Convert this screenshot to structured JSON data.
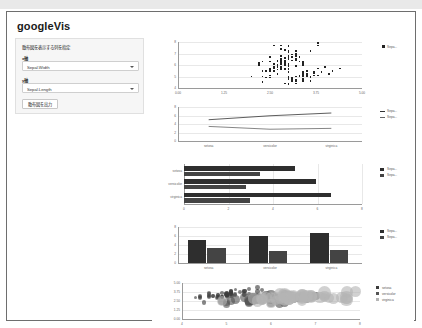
{
  "window": {
    "title": "googleVis"
  },
  "sidebar": {
    "instruction": "散布図を表示する列を指定",
    "field1": {
      "label": "x軸",
      "value": "Sepal.Width"
    },
    "field2": {
      "label": "y軸",
      "value": "Sepal.Length"
    },
    "button": {
      "label": "散布図を出力"
    }
  },
  "chart_data": [
    {
      "type": "scatter",
      "title": "",
      "xlabel": "",
      "ylabel": "",
      "xlim": [
        0,
        5
      ],
      "ylim": [
        4,
        8
      ],
      "xticks": [
        "0.00",
        "1.25",
        "2.50",
        "3.75",
        "5.00"
      ],
      "yticks": [
        "4",
        "5",
        "6",
        "7",
        "8"
      ],
      "grid": true,
      "legend_position": "right",
      "legend": [
        "Sepa..."
      ],
      "series": [
        {
          "name": "Sepal.Length",
          "x": [
            3.5,
            3.0,
            3.2,
            3.1,
            3.6,
            3.9,
            3.4,
            3.4,
            2.9,
            3.1,
            3.7,
            3.4,
            3.0,
            3.0,
            4.0,
            4.4,
            3.9,
            3.5,
            3.8,
            3.8,
            3.4,
            3.7,
            3.6,
            3.3,
            3.4,
            3.0,
            3.4,
            3.5,
            3.4,
            3.2,
            3.1,
            3.4,
            4.1,
            4.2,
            3.1,
            3.2,
            3.5,
            3.6,
            3.0,
            3.4,
            3.5,
            2.3,
            3.2,
            3.5,
            3.8,
            3.0,
            3.8,
            3.2,
            3.7,
            3.3,
            3.2,
            3.2,
            3.1,
            2.3,
            2.8,
            2.8,
            3.3,
            2.4,
            2.9,
            2.7,
            2.0,
            3.0,
            2.2,
            2.9,
            2.9,
            3.1,
            3.0,
            2.7,
            2.2,
            2.5,
            3.2,
            2.8,
            2.5,
            2.8,
            2.9,
            3.0,
            2.8,
            3.0,
            2.9,
            2.6,
            2.4,
            2.4,
            2.7,
            2.7,
            3.0,
            3.4,
            3.1,
            2.3,
            3.0,
            2.5,
            2.6,
            3.0,
            2.6,
            2.3,
            2.7,
            3.0,
            2.9,
            2.9,
            2.5,
            2.8,
            3.3,
            2.7,
            3.0,
            2.9,
            3.0,
            3.0,
            2.5,
            2.9,
            2.5,
            3.6,
            3.2,
            2.7,
            3.0,
            2.5,
            2.8,
            3.2,
            3.0,
            3.8,
            2.6,
            2.2,
            3.2,
            2.8,
            2.8,
            2.7,
            3.3,
            3.2,
            2.8,
            3.0,
            2.8,
            3.0,
            2.8,
            3.8,
            2.8,
            2.8,
            2.6,
            3.0,
            3.4,
            3.1,
            3.0,
            3.1,
            3.1,
            3.1,
            2.7,
            3.2,
            3.3,
            3.0,
            2.5,
            3.0,
            3.4,
            3.0
          ],
          "y": [
            5.1,
            4.9,
            4.7,
            4.6,
            5.0,
            5.4,
            4.6,
            5.0,
            4.4,
            4.9,
            5.4,
            4.8,
            4.8,
            4.3,
            5.8,
            5.7,
            5.4,
            5.1,
            5.7,
            5.1,
            5.4,
            5.1,
            4.6,
            5.1,
            4.8,
            5.0,
            5.0,
            5.2,
            5.2,
            4.7,
            4.8,
            5.4,
            5.2,
            5.5,
            4.9,
            5.0,
            5.5,
            4.9,
            4.4,
            5.1,
            5.0,
            4.5,
            4.4,
            5.0,
            5.1,
            4.8,
            5.1,
            4.6,
            5.3,
            5.0,
            7.0,
            6.4,
            6.9,
            5.5,
            6.5,
            5.7,
            6.3,
            4.9,
            6.6,
            5.2,
            5.0,
            5.9,
            6.0,
            6.1,
            5.6,
            6.7,
            5.6,
            5.8,
            6.2,
            5.6,
            5.9,
            6.1,
            6.3,
            6.1,
            6.4,
            6.6,
            6.8,
            6.7,
            6.0,
            5.7,
            5.5,
            5.5,
            5.8,
            6.0,
            5.4,
            6.0,
            6.7,
            6.3,
            5.6,
            5.5,
            5.5,
            6.1,
            5.8,
            5.0,
            5.6,
            5.7,
            5.7,
            6.2,
            5.1,
            5.7,
            6.3,
            5.8,
            7.1,
            6.3,
            6.5,
            7.6,
            4.9,
            7.3,
            6.7,
            7.2,
            6.5,
            6.4,
            6.8,
            5.7,
            5.8,
            6.4,
            6.5,
            7.7,
            7.7,
            6.0,
            6.9,
            5.6,
            7.7,
            6.3,
            6.7,
            7.2,
            6.2,
            6.1,
            6.4,
            7.2,
            7.4,
            7.9,
            6.4,
            6.3,
            6.1,
            7.7,
            6.3,
            6.4,
            6.0,
            6.9,
            6.7,
            6.9,
            5.8,
            6.8,
            6.7,
            6.7,
            6.3,
            6.5,
            6.2,
            5.9
          ]
        }
      ]
    },
    {
      "type": "line",
      "xlabel": "",
      "ylabel": "",
      "categories": [
        "setosa",
        "versicolor",
        "virginica"
      ],
      "ylim": [
        0,
        8
      ],
      "yticks": [
        "0",
        "2",
        "4",
        "6",
        "8"
      ],
      "grid": true,
      "legend_position": "right",
      "legend": [
        "Sepa...",
        "Sepa..."
      ],
      "series": [
        {
          "name": "Sepal.Length",
          "values": [
            5.006,
            5.936,
            6.588
          ]
        },
        {
          "name": "Sepal.Width",
          "values": [
            3.428,
            2.77,
            2.974
          ]
        }
      ]
    },
    {
      "type": "bar",
      "orientation": "horizontal",
      "categories": [
        "setosa",
        "versicolor",
        "virginica"
      ],
      "xlim": [
        0,
        8
      ],
      "xticks": [
        "0",
        "2",
        "4",
        "6",
        "8"
      ],
      "grid": true,
      "legend_position": "right",
      "legend": [
        "Sepa...",
        "Sepa..."
      ],
      "series": [
        {
          "name": "Sepal.Length",
          "values": [
            5.006,
            5.936,
            6.588
          ]
        },
        {
          "name": "Sepal.Width",
          "values": [
            3.428,
            2.77,
            2.974
          ]
        }
      ]
    },
    {
      "type": "bar",
      "orientation": "vertical",
      "categories": [
        "setosa",
        "versicolor",
        "virginica"
      ],
      "ylim": [
        0,
        8
      ],
      "yticks": [
        "0",
        "2",
        "4",
        "6",
        "8"
      ],
      "grid": true,
      "legend_position": "right",
      "legend": [
        "Sepa...",
        "Sepa..."
      ],
      "series": [
        {
          "name": "Sepal.Length",
          "values": [
            5.006,
            5.936,
            6.588
          ]
        },
        {
          "name": "Sepal.Width",
          "values": [
            3.428,
            2.77,
            2.974
          ]
        }
      ]
    },
    {
      "type": "scatter",
      "variant": "bubble",
      "xlim": [
        4,
        8
      ],
      "ylim": [
        0,
        5
      ],
      "xticks": [
        "4",
        "5",
        "6",
        "7",
        "8"
      ],
      "yticks": [
        "0.00",
        "1.25",
        "2.50",
        "3.75",
        "5.00"
      ],
      "grid": true,
      "legend_position": "right",
      "legend": [
        "setosa",
        "versicolor",
        "virginica"
      ],
      "colors": {
        "setosa": "#3c3c3c",
        "versicolor": "#555555",
        "virginica": "#b5b5b5"
      },
      "series": [
        {
          "name": "setosa",
          "x": [
            5.1,
            4.9,
            4.7,
            4.6,
            5.0,
            5.4,
            4.6,
            5.0,
            4.4,
            4.9,
            5.4,
            4.8,
            4.8,
            4.3,
            5.8,
            5.7,
            5.4,
            5.1,
            5.7,
            5.1,
            5.4,
            5.1,
            4.6,
            5.1,
            4.8,
            5.0,
            5.0,
            5.2,
            5.2,
            4.7,
            4.8,
            5.4,
            5.2,
            5.5,
            4.9,
            5.0,
            5.5,
            4.9,
            4.4,
            5.1,
            5.0,
            4.5,
            4.4,
            5.0,
            5.1,
            4.8,
            5.1,
            4.6,
            5.3,
            5.0
          ],
          "y": [
            3.5,
            3.0,
            3.2,
            3.1,
            3.6,
            3.9,
            3.4,
            3.4,
            2.9,
            3.1,
            3.7,
            3.4,
            3.0,
            3.0,
            4.0,
            4.4,
            3.9,
            3.5,
            3.8,
            3.8,
            3.4,
            3.7,
            3.6,
            3.3,
            3.4,
            3.0,
            3.4,
            3.5,
            3.4,
            3.2,
            3.1,
            3.4,
            4.1,
            4.2,
            3.1,
            3.2,
            3.5,
            3.6,
            3.0,
            3.4,
            3.5,
            2.3,
            3.2,
            3.5,
            3.8,
            3.0,
            3.8,
            3.2,
            3.7,
            3.3
          ],
          "size": [
            0.2,
            0.2,
            0.2,
            0.2,
            0.2,
            0.4,
            0.3,
            0.2,
            0.2,
            0.1,
            0.2,
            0.2,
            0.1,
            0.1,
            0.2,
            0.4,
            0.4,
            0.3,
            0.3,
            0.3,
            0.2,
            0.4,
            0.2,
            0.5,
            0.2,
            0.2,
            0.4,
            0.2,
            0.2,
            0.2,
            0.2,
            0.4,
            0.1,
            0.2,
            0.2,
            0.2,
            0.2,
            0.1,
            0.2,
            0.2,
            0.3,
            0.3,
            0.2,
            0.6,
            0.4,
            0.3,
            0.2,
            0.2,
            0.2,
            0.2
          ]
        },
        {
          "name": "versicolor",
          "x": [
            7.0,
            6.4,
            6.9,
            5.5,
            6.5,
            5.7,
            6.3,
            4.9,
            6.6,
            5.2,
            5.0,
            5.9,
            6.0,
            6.1,
            5.6,
            6.7,
            5.6,
            5.8,
            6.2,
            5.6,
            5.9,
            6.1,
            6.3,
            6.1,
            6.4,
            6.6,
            6.8,
            6.7,
            6.0,
            5.7,
            5.5,
            5.5,
            5.8,
            6.0,
            5.4,
            6.0,
            6.7,
            6.3,
            5.6,
            5.5,
            5.5,
            6.1,
            5.8,
            5.0,
            5.6,
            5.7,
            5.7,
            6.2,
            5.1,
            5.7
          ],
          "y": [
            3.2,
            3.2,
            3.1,
            2.3,
            2.8,
            2.8,
            3.3,
            2.4,
            2.9,
            2.7,
            2.0,
            3.0,
            2.2,
            2.9,
            2.9,
            3.1,
            3.0,
            2.7,
            2.2,
            2.5,
            3.2,
            2.8,
            2.5,
            2.8,
            2.9,
            3.0,
            2.8,
            3.0,
            2.9,
            2.6,
            2.4,
            2.4,
            2.7,
            2.7,
            3.0,
            3.4,
            3.1,
            2.3,
            3.0,
            2.5,
            2.6,
            3.0,
            2.6,
            2.3,
            2.7,
            3.0,
            2.9,
            2.9,
            2.5,
            2.8
          ],
          "size": [
            1.4,
            1.5,
            1.5,
            1.3,
            1.5,
            1.3,
            1.6,
            1.0,
            1.3,
            1.4,
            1.0,
            1.5,
            1.0,
            1.4,
            1.3,
            1.4,
            1.5,
            1.0,
            1.5,
            1.1,
            1.8,
            1.3,
            1.5,
            1.2,
            1.3,
            1.4,
            1.4,
            1.7,
            1.5,
            1.0,
            1.1,
            1.0,
            1.2,
            1.6,
            1.5,
            1.6,
            1.5,
            1.3,
            1.3,
            1.2,
            1.4,
            1.4,
            1.2,
            1.0,
            1.3,
            1.2,
            1.3,
            1.3,
            1.1,
            1.3
          ]
        },
        {
          "name": "virginica",
          "x": [
            6.3,
            5.8,
            7.1,
            6.3,
            6.5,
            7.6,
            4.9,
            7.3,
            6.7,
            7.2,
            6.5,
            6.4,
            6.8,
            5.7,
            5.8,
            6.4,
            6.5,
            7.7,
            7.7,
            6.0,
            6.9,
            5.6,
            7.7,
            6.3,
            6.7,
            7.2,
            6.2,
            6.1,
            6.4,
            7.2,
            7.4,
            7.9,
            6.4,
            6.3,
            6.1,
            7.7,
            6.3,
            6.4,
            6.0,
            6.9,
            6.7,
            6.9,
            5.8,
            6.8,
            6.7,
            6.7,
            6.3,
            6.5,
            6.2,
            5.9
          ],
          "y": [
            3.3,
            2.7,
            3.0,
            2.9,
            3.0,
            3.0,
            2.5,
            2.9,
            2.5,
            3.6,
            3.2,
            2.7,
            3.0,
            2.5,
            2.8,
            3.2,
            3.0,
            3.8,
            2.6,
            2.2,
            3.2,
            2.8,
            2.8,
            2.7,
            3.3,
            3.2,
            2.8,
            3.0,
            2.8,
            3.0,
            2.8,
            3.8,
            2.8,
            2.8,
            2.6,
            3.0,
            3.4,
            3.1,
            3.0,
            3.1,
            3.1,
            3.1,
            2.7,
            3.2,
            3.3,
            3.0,
            2.5,
            3.0,
            3.4,
            3.0
          ],
          "size": [
            2.5,
            1.9,
            2.1,
            1.8,
            2.2,
            2.1,
            1.7,
            1.8,
            1.8,
            2.5,
            2.0,
            1.9,
            2.1,
            2.0,
            2.4,
            2.3,
            1.8,
            2.2,
            2.3,
            1.5,
            2.3,
            2.0,
            2.0,
            1.8,
            2.1,
            1.8,
            1.8,
            1.8,
            2.1,
            1.6,
            1.9,
            2.0,
            2.2,
            1.5,
            1.4,
            2.3,
            2.4,
            1.8,
            1.8,
            2.1,
            2.4,
            2.3,
            1.9,
            2.3,
            2.5,
            2.3,
            1.9,
            2.0,
            2.3,
            1.8
          ]
        }
      ]
    }
  ]
}
